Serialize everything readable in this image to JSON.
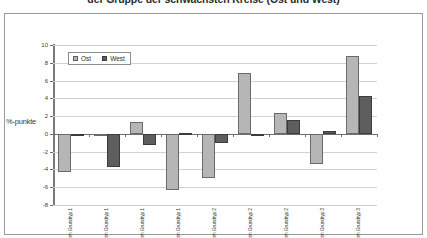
{
  "title": "der Gruppe der schwächsten Kreise (Ost und West)",
  "axis": {
    "ylabel": "%-punkte",
    "yticks": [
      "10",
      "8",
      "6",
      "4",
      "2",
      "0",
      "-2",
      "-4",
      "-6",
      "-8"
    ]
  },
  "legend": {
    "position": "top-left-inside",
    "entries": [
      {
        "label": "Ost",
        "color": "#b6b6b6",
        "swatch": "square-swatch"
      },
      {
        "label": "West",
        "color": "#5e5e5e",
        "swatch": "square-swatch"
      }
    ]
  },
  "chart_data": {
    "type": "bar",
    "title": "der Gruppe der schwächsten Kreise (Ost und West)",
    "xlabel": "",
    "ylabel": "%-punkte",
    "ylim": [
      -8,
      10
    ],
    "ytick_step": 2,
    "grid": true,
    "categories": [
      "1. Kernstädte im Grundtyp 1",
      "2. Hochverdichtete Kreise im Grundtyp 1",
      "3. Verdichtete Kreise im Grundtyp 1",
      "4. Ländliche Kreise im Grundtyp 1",
      "5. Kernstädte im Grundtyp 2",
      "6. Verdichtete Kreise im Grundtyp 2",
      "7. Ländliche Kreise im Grundtyp 2",
      "8. Ländliche Kreise höherer Dichte im Grundtyp 3",
      "9. Ländliche Kreise geringerer Dichte im Grundtyp 3"
    ],
    "series": [
      {
        "name": "Ost",
        "color": "#b6b6b6",
        "values": [
          -4.3,
          -0.1,
          1.3,
          -6.3,
          -5.0,
          6.8,
          2.3,
          -3.4,
          8.8
        ]
      },
      {
        "name": "West",
        "color": "#5e5e5e",
        "values": [
          -0.2,
          -3.7,
          -1.2,
          0.1,
          -1.0,
          -0.2,
          1.6,
          0.3,
          4.3
        ]
      }
    ]
  }
}
